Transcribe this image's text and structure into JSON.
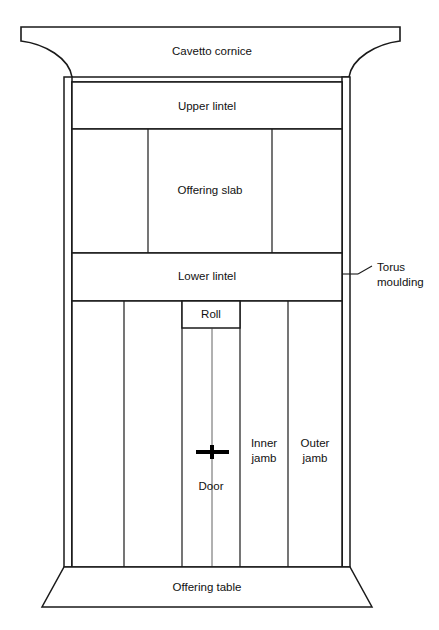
{
  "diagram": {
    "background_color": "#ffffff",
    "line_color": "#1a1a1a",
    "width": 439,
    "height": 630
  },
  "labels": {
    "cavetto_cornice": "Cavetto cornice",
    "upper_lintel": "Upper lintel",
    "offering_slab": "Offering slab",
    "lower_lintel": "Lower lintel",
    "roll": "Roll",
    "door": "Door",
    "inner_jamb_line1": "Inner",
    "inner_jamb_line2": "jamb",
    "outer_jamb_line1": "Outer",
    "outer_jamb_line2": "jamb",
    "offering_table": "Offering table",
    "torus_moulding_line1": "Torus",
    "torus_moulding_line2": "moulding"
  },
  "parts": [
    {
      "name": "cavetto-cornice",
      "label": "Cavetto cornice",
      "position": "top"
    },
    {
      "name": "torus-moulding",
      "label": "Torus moulding",
      "position": "left-and-right-edges"
    },
    {
      "name": "upper-lintel",
      "label": "Upper lintel",
      "position": "upper-band"
    },
    {
      "name": "offering-slab",
      "label": "Offering slab",
      "position": "central-panel"
    },
    {
      "name": "lower-lintel",
      "label": "Lower lintel",
      "position": "middle-band"
    },
    {
      "name": "roll",
      "label": "Roll",
      "position": "above-door"
    },
    {
      "name": "door",
      "label": "Door",
      "position": "center-bottom"
    },
    {
      "name": "inner-jamb",
      "label": "Inner jamb",
      "position": "flanking-door"
    },
    {
      "name": "outer-jamb",
      "label": "Outer jamb",
      "position": "outermost-column"
    },
    {
      "name": "offering-table",
      "label": "Offering table",
      "position": "base"
    }
  ]
}
